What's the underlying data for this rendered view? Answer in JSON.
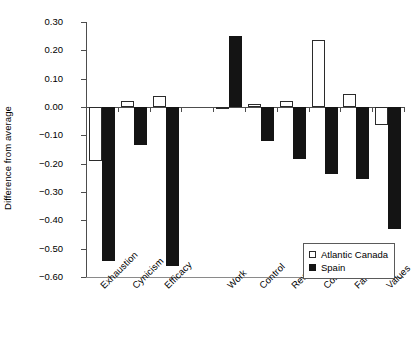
{
  "chart_data": {
    "type": "bar",
    "title": "",
    "xlabel": "",
    "ylabel": "Difference from average",
    "ylim": [
      -0.6,
      0.3
    ],
    "ytick_labels": [
      "0.30",
      "0.20",
      "0.10",
      "0.00",
      "-0.10",
      "-0.20",
      "-0.30",
      "-0.40",
      "-0.50",
      "-0.60"
    ],
    "ytick_values": [
      0.3,
      0.2,
      0.1,
      0.0,
      -0.1,
      -0.2,
      -0.3,
      -0.4,
      -0.5,
      -0.6
    ],
    "grid": false,
    "legend_position": "bottom-right",
    "categories": [
      "Exhaustion",
      "Cynicism",
      "Efficacy",
      "Work",
      "Control",
      "Reward",
      "Community",
      "Fairness",
      "Values"
    ],
    "group_gap_after_index": 2,
    "series": [
      {
        "name": "Atlantic Canada",
        "style": "open",
        "color": "#ffffff",
        "edge_color": "#2b2b2b",
        "values": [
          -0.19,
          0.02,
          0.04,
          -0.005,
          0.01,
          0.02,
          0.235,
          0.045,
          -0.065
        ]
      },
      {
        "name": "Spain",
        "style": "filled",
        "color": "#141414",
        "edge_color": "#141414",
        "values": [
          -0.545,
          -0.135,
          -0.56,
          0.25,
          -0.12,
          -0.185,
          -0.235,
          -0.255,
          -0.43
        ]
      }
    ]
  },
  "legend": {
    "items": [
      {
        "label": "Atlantic Canada",
        "swatch": "open-square"
      },
      {
        "label": "Spain",
        "swatch": "filled-square"
      }
    ]
  }
}
